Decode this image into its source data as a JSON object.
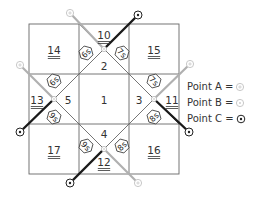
{
  "diagram": {
    "regions": [
      {
        "id": "14",
        "label": "14",
        "underlined": true,
        "x": 54,
        "y": 50
      },
      {
        "id": "10",
        "label": "10",
        "underlined": true,
        "x": 104,
        "y": 35
      },
      {
        "id": "15",
        "label": "15",
        "underlined": true,
        "x": 154,
        "y": 50
      },
      {
        "id": "2",
        "label": "2",
        "underlined": false,
        "x": 104,
        "y": 66
      },
      {
        "id": "13",
        "label": "13",
        "underlined": true,
        "x": 37,
        "y": 100
      },
      {
        "id": "5",
        "label": "5",
        "underlined": false,
        "x": 68,
        "y": 100
      },
      {
        "id": "1",
        "label": "1",
        "underlined": false,
        "x": 104,
        "y": 100
      },
      {
        "id": "3",
        "label": "3",
        "underlined": false,
        "x": 139,
        "y": 100
      },
      {
        "id": "11",
        "label": "11",
        "underlined": true,
        "x": 172,
        "y": 100
      },
      {
        "id": "4",
        "label": "4",
        "underlined": false,
        "x": 104,
        "y": 134
      },
      {
        "id": "12",
        "label": "12",
        "underlined": true,
        "x": 104,
        "y": 162
      },
      {
        "id": "17",
        "label": "17",
        "underlined": true,
        "x": 54,
        "y": 150
      },
      {
        "id": "16",
        "label": "16",
        "underlined": true,
        "x": 154,
        "y": 150
      }
    ],
    "badges": [
      {
        "label": "6s",
        "x": 86,
        "y": 53,
        "rotate": -45
      },
      {
        "label": "7s",
        "x": 122,
        "y": 53,
        "rotate": 45
      },
      {
        "label": "6s",
        "x": 54,
        "y": 81,
        "rotate": -45
      },
      {
        "label": "9s",
        "x": 54,
        "y": 117,
        "rotate": 45
      },
      {
        "label": "7s",
        "x": 154,
        "y": 81,
        "rotate": 45
      },
      {
        "label": "8s",
        "x": 154,
        "y": 117,
        "rotate": -45
      },
      {
        "label": "9s",
        "x": 86,
        "y": 146,
        "rotate": 45
      },
      {
        "label": "8s",
        "x": 122,
        "y": 146,
        "rotate": -45
      }
    ],
    "paths": [
      {
        "from": "A",
        "fx": 70,
        "fy": 13,
        "via_x": 104,
        "via_y": 49,
        "to": "C",
        "tx": 138,
        "ty": 15
      },
      {
        "from": "A",
        "fx": 20,
        "fy": 65,
        "via_x": 54,
        "via_y": 99,
        "to": "C",
        "tx": 20,
        "ty": 132
      },
      {
        "from": "A",
        "fx": 190,
        "fy": 64,
        "via_x": 154,
        "via_y": 99,
        "to": "C",
        "tx": 189,
        "ty": 132
      },
      {
        "from": "A",
        "fx": 138,
        "fy": 183,
        "via_x": 104,
        "via_y": 149,
        "to": "C",
        "tx": 70,
        "ty": 183
      }
    ]
  },
  "legend": {
    "items": [
      {
        "label": "Point A =",
        "symbol": "point-a"
      },
      {
        "label": "Point B =",
        "symbol": "point-b"
      },
      {
        "label": "Point C =",
        "symbol": "point-c"
      }
    ]
  },
  "colors": {
    "grid": "#555555",
    "path_dark": "#1a1a1a",
    "path_light": "#b0b0b0",
    "text": "#333333"
  }
}
